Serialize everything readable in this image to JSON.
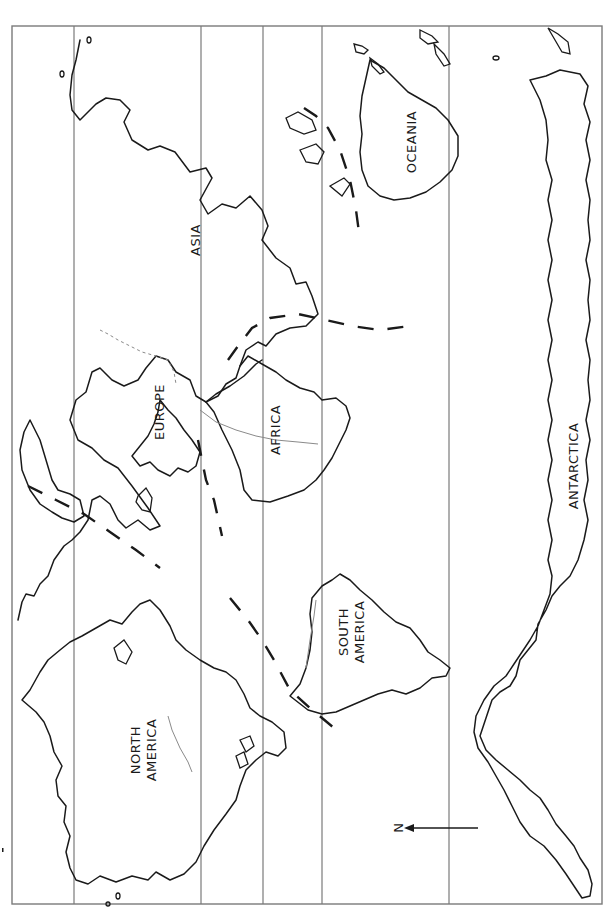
{
  "map": {
    "title": "",
    "orientation": "rotated 90 degrees; north points left",
    "continent_labels": [
      {
        "name": "north_america",
        "text": "NORTH"
      },
      {
        "name": "north_america_2",
        "text": "AMERICA"
      },
      {
        "name": "south_america",
        "text": "SOUTH"
      },
      {
        "name": "south_america_2",
        "text": "AMERICA"
      },
      {
        "name": "europe",
        "text": "EUROPE"
      },
      {
        "name": "africa",
        "text": "AFRICA"
      },
      {
        "name": "asia",
        "text": "ASIA"
      },
      {
        "name": "oceania",
        "text": "OCEANIA"
      },
      {
        "name": "antarctica",
        "text": "ANTARCTICA"
      }
    ],
    "compass": {
      "letter": "N",
      "direction": "left"
    },
    "latitude_lines_count": 5,
    "colors": {
      "coastline": "#1a1a1a",
      "grid": "#7a7a7a",
      "river": "#8a8a8a",
      "background": "#ffffff"
    }
  }
}
